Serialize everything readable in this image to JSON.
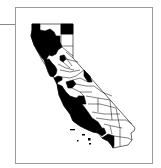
{
  "figure": {
    "type": "choropleth-map",
    "region": "California counties",
    "colors": {
      "filled": "#000000",
      "unfilled": "#ffffff",
      "border": "#000000",
      "frame": "#9a9a9a"
    }
  },
  "counties": [
    {
      "name": "Del Norte",
      "filled": true
    },
    {
      "name": "Siskiyou",
      "filled": false
    },
    {
      "name": "Modoc",
      "filled": true
    },
    {
      "name": "Humboldt",
      "filled": true
    },
    {
      "name": "Trinity",
      "filled": true
    },
    {
      "name": "Shasta",
      "filled": true
    },
    {
      "name": "Lassen",
      "filled": false
    },
    {
      "name": "Mendocino",
      "filled": true
    },
    {
      "name": "Tehama",
      "filled": true
    },
    {
      "name": "Plumas",
      "filled": false
    },
    {
      "name": "Glenn",
      "filled": false
    },
    {
      "name": "Butte",
      "filled": true
    },
    {
      "name": "Sierra",
      "filled": false
    },
    {
      "name": "Lake",
      "filled": true
    },
    {
      "name": "Colusa",
      "filled": false
    },
    {
      "name": "Sutter",
      "filled": false
    },
    {
      "name": "Yuba",
      "filled": true
    },
    {
      "name": "Nevada",
      "filled": false
    },
    {
      "name": "Placer",
      "filled": false
    },
    {
      "name": "Sonoma",
      "filled": true
    },
    {
      "name": "Napa",
      "filled": true
    },
    {
      "name": "Yolo",
      "filled": false
    },
    {
      "name": "Sacramento",
      "filled": false
    },
    {
      "name": "El Dorado",
      "filled": false
    },
    {
      "name": "Alpine",
      "filled": true
    },
    {
      "name": "Marin",
      "filled": true
    },
    {
      "name": "Solano",
      "filled": false
    },
    {
      "name": "Contra Costa",
      "filled": true
    },
    {
      "name": "San Joaquin",
      "filled": false
    },
    {
      "name": "Amador",
      "filled": false
    },
    {
      "name": "Calaveras",
      "filled": false
    },
    {
      "name": "Tuolumne",
      "filled": false
    },
    {
      "name": "Mono",
      "filled": true
    },
    {
      "name": "San Francisco",
      "filled": true
    },
    {
      "name": "San Mateo",
      "filled": true
    },
    {
      "name": "Alameda",
      "filled": false
    },
    {
      "name": "Santa Clara",
      "filled": false
    },
    {
      "name": "Stanislaus",
      "filled": true
    },
    {
      "name": "Mariposa",
      "filled": false
    },
    {
      "name": "Merced",
      "filled": true
    },
    {
      "name": "Madera",
      "filled": false
    },
    {
      "name": "Santa Cruz",
      "filled": true
    },
    {
      "name": "San Benito",
      "filled": true
    },
    {
      "name": "Monterey",
      "filled": true
    },
    {
      "name": "Fresno",
      "filled": false
    },
    {
      "name": "Inyo",
      "filled": false
    },
    {
      "name": "Kings",
      "filled": true
    },
    {
      "name": "Tulare",
      "filled": false
    },
    {
      "name": "San Luis Obispo",
      "filled": true
    },
    {
      "name": "Kern",
      "filled": false
    },
    {
      "name": "Santa Barbara",
      "filled": true
    },
    {
      "name": "Ventura",
      "filled": true
    },
    {
      "name": "Los Angeles",
      "filled": true
    },
    {
      "name": "San Bernardino",
      "filled": false
    },
    {
      "name": "Orange",
      "filled": true
    },
    {
      "name": "Riverside",
      "filled": false
    },
    {
      "name": "San Diego",
      "filled": true
    },
    {
      "name": "Imperial",
      "filled": false
    }
  ]
}
